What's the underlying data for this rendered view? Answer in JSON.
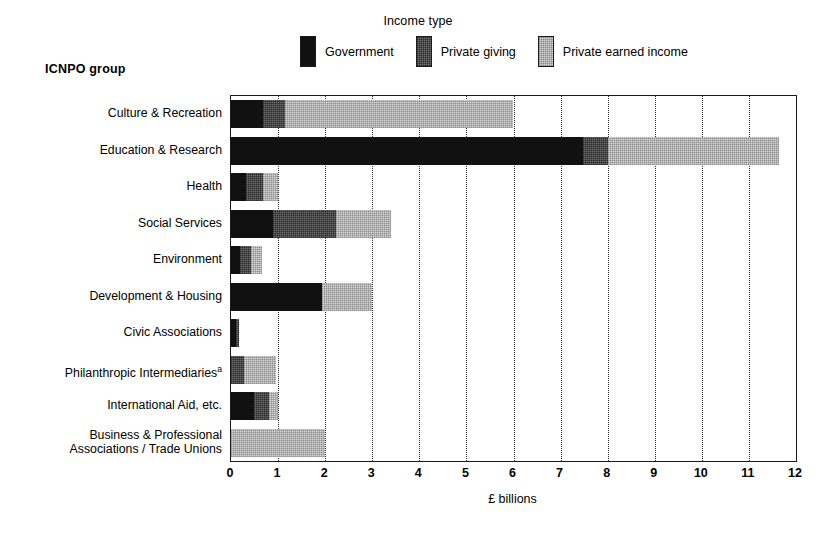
{
  "chart_data": {
    "type": "bar",
    "orientation": "horizontal",
    "stacked": true,
    "title": "",
    "xlabel": "£ billions",
    "ylabel": "ICNPO group",
    "xlim": [
      0,
      12
    ],
    "xticks": [
      0,
      1,
      2,
      3,
      4,
      5,
      6,
      7,
      8,
      9,
      10,
      11,
      12
    ],
    "grid": "vertical-dotted",
    "legend": {
      "title": "Income type",
      "position": "top",
      "entries": [
        {
          "label": "Government",
          "key": "government",
          "color": "#111111"
        },
        {
          "label": "Private giving",
          "key": "private_giving",
          "color": "#6b6b6b"
        },
        {
          "label": "Private earned income",
          "key": "private_earned_income",
          "color": "#d4d4d4"
        }
      ]
    },
    "categories": [
      "Culture & Recreation",
      "Education & Research",
      "Health",
      "Social Services",
      "Environment",
      "Development & Housing",
      "Civic Associations",
      "Philanthropic Intermediaries",
      "International Aid, etc.",
      "Business & Professional\nAssociations / Trade Unions"
    ],
    "category_footnotes": {
      "Philanthropic Intermediaries": "a"
    },
    "series": [
      {
        "name": "Government",
        "key": "government",
        "values": [
          0.68,
          7.47,
          0.32,
          0.9,
          0.19,
          1.93,
          0.1,
          0.0,
          0.49,
          0.0
        ]
      },
      {
        "name": "Private giving",
        "key": "private_giving",
        "values": [
          0.46,
          0.53,
          0.36,
          1.33,
          0.23,
          0.0,
          0.07,
          0.28,
          0.31,
          0.0
        ]
      },
      {
        "name": "Private earned income",
        "key": "private_earned_income",
        "values": [
          4.86,
          3.63,
          0.32,
          1.17,
          0.23,
          1.07,
          0.0,
          0.67,
          0.2,
          2.0
        ]
      }
    ],
    "totals": [
      6.0,
      11.63,
      1.0,
      3.4,
      0.65,
      3.0,
      0.17,
      0.95,
      1.0,
      2.0
    ]
  }
}
